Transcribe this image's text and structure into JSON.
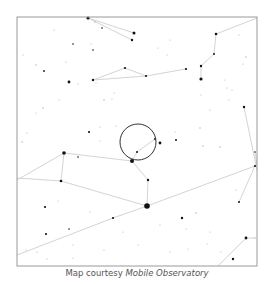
{
  "caption": {
    "prefix": "Map courtesy ",
    "source": "Mobile Observatory"
  },
  "map": {
    "frame": {
      "x": 17,
      "y": 17,
      "width": 240,
      "height": 249,
      "color": "#999999"
    },
    "colors": {
      "background": "#ffffff",
      "line": "#d4d4d4",
      "star": "#111111",
      "faint_star": "#b0b0b0",
      "circle": "#333333"
    },
    "target_circle": {
      "cx": 138,
      "cy": 142,
      "r": 18
    },
    "constellation_lines": [
      [
        [
          88,
          18
        ],
        [
          134,
          33
        ]
      ],
      [
        [
          88,
          18
        ],
        [
          132,
          40
        ]
      ],
      [
        [
          93,
          80
        ],
        [
          125,
          68
        ]
      ],
      [
        [
          125,
          68
        ],
        [
          146,
          76
        ]
      ],
      [
        [
          93,
          80
        ],
        [
          146,
          76
        ]
      ],
      [
        [
          146,
          76
        ],
        [
          186,
          69
        ]
      ],
      [
        [
          216,
          34
        ],
        [
          257,
          18
        ]
      ],
      [
        [
          216,
          34
        ],
        [
          214,
          54
        ]
      ],
      [
        [
          214,
          54
        ],
        [
          201,
          66
        ]
      ],
      [
        [
          201,
          66
        ],
        [
          201,
          79
        ]
      ],
      [
        [
          137,
          152
        ],
        [
          132,
          161
        ]
      ],
      [
        [
          137,
          152
        ],
        [
          155,
          139
        ]
      ],
      [
        [
          64,
          153
        ],
        [
          132,
          161
        ]
      ],
      [
        [
          132,
          161
        ],
        [
          148,
          180
        ]
      ],
      [
        [
          148,
          180
        ],
        [
          147,
          206
        ]
      ],
      [
        [
          64,
          153
        ],
        [
          17,
          180
        ]
      ],
      [
        [
          64,
          153
        ],
        [
          61,
          181
        ]
      ],
      [
        [
          61,
          181
        ],
        [
          17,
          178
        ]
      ],
      [
        [
          61,
          181
        ],
        [
          147,
          206
        ]
      ],
      [
        [
          147,
          206
        ],
        [
          255,
          166
        ]
      ],
      [
        [
          255,
          166
        ],
        [
          239,
          202
        ]
      ],
      [
        [
          17,
          255
        ],
        [
          113,
          218
        ]
      ],
      [
        [
          113,
          218
        ],
        [
          147,
          206
        ]
      ],
      [
        [
          246,
          238
        ],
        [
          255,
          238
        ]
      ],
      [
        [
          246,
          238
        ],
        [
          218,
          266
        ]
      ],
      [
        [
          244,
          107
        ],
        [
          257,
          170
        ]
      ],
      [
        [
          255,
          152
        ],
        [
          257,
          166
        ]
      ]
    ],
    "stars": [
      {
        "x": 88,
        "y": 18,
        "r": 1.6
      },
      {
        "x": 134,
        "y": 33,
        "r": 1.5
      },
      {
        "x": 132,
        "y": 40,
        "r": 1.2
      },
      {
        "x": 102,
        "y": 28,
        "r": 0.8
      },
      {
        "x": 95,
        "y": 22,
        "r": 0.7
      },
      {
        "x": 73,
        "y": 44,
        "r": 0.8
      },
      {
        "x": 93,
        "y": 50,
        "r": 0.8
      },
      {
        "x": 91,
        "y": 44,
        "r": 0.6
      },
      {
        "x": 23,
        "y": 55,
        "r": 0.6
      },
      {
        "x": 36,
        "y": 65,
        "r": 0.7
      },
      {
        "x": 44,
        "y": 71,
        "r": 0.9
      },
      {
        "x": 69,
        "y": 82,
        "r": 1.4
      },
      {
        "x": 93,
        "y": 80,
        "r": 1.2
      },
      {
        "x": 96,
        "y": 83,
        "r": 0.6
      },
      {
        "x": 125,
        "y": 68,
        "r": 1.1
      },
      {
        "x": 146,
        "y": 76,
        "r": 1.1
      },
      {
        "x": 186,
        "y": 69,
        "r": 1.1
      },
      {
        "x": 216,
        "y": 34,
        "r": 1.3
      },
      {
        "x": 214,
        "y": 54,
        "r": 1.0
      },
      {
        "x": 201,
        "y": 66,
        "r": 1.2
      },
      {
        "x": 201,
        "y": 79,
        "r": 1.6
      },
      {
        "x": 239,
        "y": 35,
        "r": 0.6
      },
      {
        "x": 246,
        "y": 57,
        "r": 0.7
      },
      {
        "x": 243,
        "y": 64,
        "r": 0.6
      },
      {
        "x": 225,
        "y": 80,
        "r": 0.6
      },
      {
        "x": 232,
        "y": 90,
        "r": 0.6
      },
      {
        "x": 227,
        "y": 88,
        "r": 0.6
      },
      {
        "x": 244,
        "y": 107,
        "r": 1.2
      },
      {
        "x": 200,
        "y": 128,
        "r": 0.7
      },
      {
        "x": 167,
        "y": 55,
        "r": 0.6
      },
      {
        "x": 158,
        "y": 48,
        "r": 0.6
      },
      {
        "x": 114,
        "y": 93,
        "r": 0.6
      },
      {
        "x": 112,
        "y": 99,
        "r": 0.6
      },
      {
        "x": 104,
        "y": 100,
        "r": 0.7
      },
      {
        "x": 100,
        "y": 127,
        "r": 0.6
      },
      {
        "x": 89,
        "y": 132,
        "r": 1.1
      },
      {
        "x": 43,
        "y": 108,
        "r": 0.7
      },
      {
        "x": 36,
        "y": 113,
        "r": 0.6
      },
      {
        "x": 27,
        "y": 133,
        "r": 0.6
      },
      {
        "x": 22,
        "y": 142,
        "r": 0.7
      },
      {
        "x": 137,
        "y": 152,
        "r": 1.0
      },
      {
        "x": 155,
        "y": 139,
        "r": 1.0
      },
      {
        "x": 160,
        "y": 143,
        "r": 1.4
      },
      {
        "x": 176,
        "y": 140,
        "r": 1.0
      },
      {
        "x": 132,
        "y": 161,
        "r": 2.0
      },
      {
        "x": 148,
        "y": 180,
        "r": 1.2
      },
      {
        "x": 147,
        "y": 206,
        "r": 2.8
      },
      {
        "x": 64,
        "y": 153,
        "r": 1.8
      },
      {
        "x": 78,
        "y": 157,
        "r": 0.8
      },
      {
        "x": 61,
        "y": 181,
        "r": 1.3
      },
      {
        "x": 45,
        "y": 207,
        "r": 1.1
      },
      {
        "x": 46,
        "y": 234,
        "r": 1.1
      },
      {
        "x": 69,
        "y": 229,
        "r": 0.8
      },
      {
        "x": 113,
        "y": 218,
        "r": 1.1
      },
      {
        "x": 182,
        "y": 218,
        "r": 1.2
      },
      {
        "x": 196,
        "y": 213,
        "r": 0.7
      },
      {
        "x": 239,
        "y": 202,
        "r": 1.0
      },
      {
        "x": 255,
        "y": 166,
        "r": 1.1
      },
      {
        "x": 255,
        "y": 152,
        "r": 0.8
      },
      {
        "x": 220,
        "y": 147,
        "r": 0.7
      },
      {
        "x": 203,
        "y": 146,
        "r": 0.7
      },
      {
        "x": 246,
        "y": 238,
        "r": 1.4
      },
      {
        "x": 255,
        "y": 238,
        "r": 0.7
      },
      {
        "x": 233,
        "y": 259,
        "r": 1.2
      },
      {
        "x": 207,
        "y": 244,
        "r": 0.6
      },
      {
        "x": 188,
        "y": 249,
        "r": 0.6
      },
      {
        "x": 37,
        "y": 252,
        "r": 0.6
      },
      {
        "x": 26,
        "y": 250,
        "r": 0.6
      },
      {
        "x": 47,
        "y": 259,
        "r": 0.6
      },
      {
        "x": 73,
        "y": 258,
        "r": 0.6
      },
      {
        "x": 236,
        "y": 190,
        "r": 0.6
      },
      {
        "x": 175,
        "y": 132,
        "r": 0.6
      },
      {
        "x": 100,
        "y": 141,
        "r": 0.6
      },
      {
        "x": 116,
        "y": 126,
        "r": 0.6
      },
      {
        "x": 170,
        "y": 40,
        "r": 0.6
      },
      {
        "x": 201,
        "y": 95,
        "r": 0.6
      },
      {
        "x": 229,
        "y": 100,
        "r": 0.6
      },
      {
        "x": 210,
        "y": 110,
        "r": 0.6
      },
      {
        "x": 58,
        "y": 201,
        "r": 0.6
      },
      {
        "x": 73,
        "y": 245,
        "r": 0.6
      },
      {
        "x": 90,
        "y": 212,
        "r": 0.6
      },
      {
        "x": 123,
        "y": 232,
        "r": 0.6
      },
      {
        "x": 160,
        "y": 225,
        "r": 0.6
      },
      {
        "x": 186,
        "y": 229,
        "r": 0.6
      },
      {
        "x": 210,
        "y": 232,
        "r": 0.6
      },
      {
        "x": 170,
        "y": 252,
        "r": 0.6
      },
      {
        "x": 138,
        "y": 245,
        "r": 0.6
      },
      {
        "x": 104,
        "y": 250,
        "r": 0.6
      },
      {
        "x": 221,
        "y": 252,
        "r": 0.6
      },
      {
        "x": 59,
        "y": 100,
        "r": 0.6
      },
      {
        "x": 78,
        "y": 84,
        "r": 0.6
      },
      {
        "x": 54,
        "y": 30,
        "r": 0.6
      },
      {
        "x": 66,
        "y": 62,
        "r": 0.6
      }
    ]
  }
}
